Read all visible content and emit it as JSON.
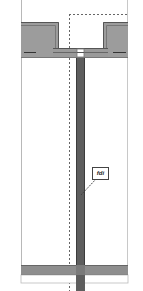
{
  "drawing": {
    "type": "architectural-section-detail",
    "callout": {
      "label": "fdi"
    },
    "colors": {
      "background": "#ffffff",
      "outline": "#b0b0b0",
      "slab_fill": "#9a9a9a",
      "slab_edge": "#5a5a5a",
      "column_fill": "#5e5e5e",
      "beam_fill": "#8e8e8e",
      "dash": "#555555"
    }
  }
}
